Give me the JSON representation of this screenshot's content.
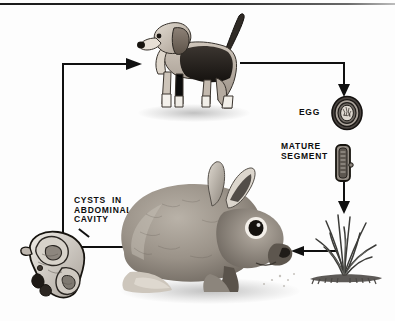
{
  "figure": {
    "type": "life-cycle-diagram",
    "background_color": "#fdfdfd",
    "line_color": "#101010"
  },
  "labels": {
    "egg": "EGG",
    "mature_segment": "MATURE\nSEGMENT",
    "cysts": "CYSTS  IN\nABDOMINAL\nCAVITY"
  },
  "nodes": [
    {
      "id": "dog",
      "name": "beagle-dog",
      "caption": ""
    },
    {
      "id": "egg",
      "name": "tapeworm-egg",
      "caption": "EGG"
    },
    {
      "id": "segment",
      "name": "mature-proglottid",
      "caption": "MATURE SEGMENT"
    },
    {
      "id": "grass",
      "name": "grass-clump",
      "caption": ""
    },
    {
      "id": "rabbit",
      "name": "rabbit",
      "caption": ""
    },
    {
      "id": "cysts",
      "name": "cysts-organ-mass",
      "caption": "CYSTS IN ABDOMINAL CAVITY"
    }
  ],
  "connectors": [
    {
      "from": "cysts",
      "to": "dog",
      "direction": "right",
      "style": "elbow"
    },
    {
      "from": "dog",
      "to": "egg",
      "direction": "down",
      "style": "elbow"
    },
    {
      "from": "egg",
      "to": "segment",
      "direction": "down",
      "style": "implied"
    },
    {
      "from": "segment",
      "to": "grass",
      "direction": "down",
      "style": "straight"
    },
    {
      "from": "grass",
      "to": "rabbit",
      "direction": "left",
      "style": "straight"
    },
    {
      "from": "rabbit",
      "to": "cysts",
      "direction": "left",
      "style": "straight"
    }
  ]
}
